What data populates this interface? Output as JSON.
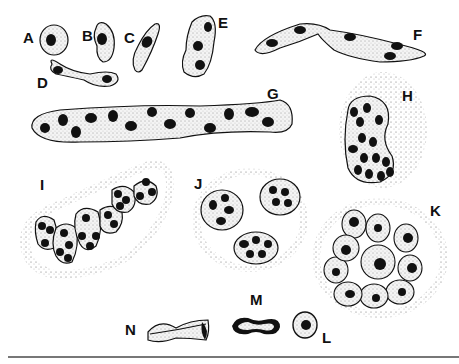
{
  "figure": {
    "labels": [
      {
        "id": "A",
        "text": "A",
        "x": 23,
        "y": 28
      },
      {
        "id": "B",
        "text": "B",
        "x": 82,
        "y": 28
      },
      {
        "id": "C",
        "text": "C",
        "x": 124,
        "y": 30
      },
      {
        "id": "D",
        "text": "D",
        "x": 37,
        "y": 75
      },
      {
        "id": "E",
        "text": "E",
        "x": 218,
        "y": 15
      },
      {
        "id": "F",
        "text": "F",
        "x": 413,
        "y": 27
      },
      {
        "id": "G",
        "text": "G",
        "x": 267,
        "y": 86
      },
      {
        "id": "H",
        "text": "H",
        "x": 402,
        "y": 88
      },
      {
        "id": "I",
        "text": "I",
        "x": 40,
        "y": 177
      },
      {
        "id": "J",
        "text": "J",
        "x": 194,
        "y": 176
      },
      {
        "id": "K",
        "text": "K",
        "x": 430,
        "y": 203
      },
      {
        "id": "M",
        "text": "M",
        "x": 250,
        "y": 290
      },
      {
        "id": "N",
        "text": "N",
        "x": 125,
        "y": 322
      },
      {
        "id": "L",
        "text": "L",
        "x": 322,
        "y": 330
      }
    ],
    "colors": {
      "ink": "#111111",
      "cell_fill": "#f2f2f2",
      "stipple": "#555555",
      "rule": "#777777"
    }
  }
}
